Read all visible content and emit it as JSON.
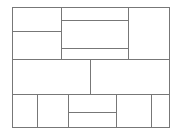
{
  "diagram": {
    "type": "layout-wireframe",
    "canvas": {
      "width": 178,
      "height": 134
    },
    "line_color": "#777777",
    "background": "#ffffff",
    "outer": {
      "x": 12,
      "y": 7,
      "w": 158,
      "h": 121
    },
    "panels": [
      {
        "id": "top-left-upper",
        "x": 12,
        "y": 7,
        "w": 50,
        "h": 25
      },
      {
        "id": "top-left-lower",
        "x": 12,
        "y": 31,
        "w": 50,
        "h": 29
      },
      {
        "id": "top-center-upper",
        "x": 61,
        "y": 7,
        "w": 68,
        "h": 14
      },
      {
        "id": "top-center-middle",
        "x": 61,
        "y": 20,
        "w": 68,
        "h": 29
      },
      {
        "id": "top-center-lower",
        "x": 61,
        "y": 48,
        "w": 68,
        "h": 12
      },
      {
        "id": "top-right",
        "x": 128,
        "y": 7,
        "w": 42,
        "h": 53
      },
      {
        "id": "middle-left",
        "x": 12,
        "y": 59,
        "w": 79,
        "h": 36
      },
      {
        "id": "middle-right",
        "x": 90,
        "y": 59,
        "w": 80,
        "h": 36
      },
      {
        "id": "bottom-col-1",
        "x": 12,
        "y": 94,
        "w": 26,
        "h": 34
      },
      {
        "id": "bottom-col-2",
        "x": 37,
        "y": 94,
        "w": 32,
        "h": 34
      },
      {
        "id": "bottom-col-3-upper",
        "x": 68,
        "y": 94,
        "w": 49,
        "h": 19
      },
      {
        "id": "bottom-col-3-lower",
        "x": 68,
        "y": 112,
        "w": 49,
        "h": 16
      },
      {
        "id": "bottom-col-4",
        "x": 116,
        "y": 94,
        "w": 36,
        "h": 34
      },
      {
        "id": "bottom-col-5",
        "x": 151,
        "y": 94,
        "w": 19,
        "h": 34
      }
    ]
  }
}
